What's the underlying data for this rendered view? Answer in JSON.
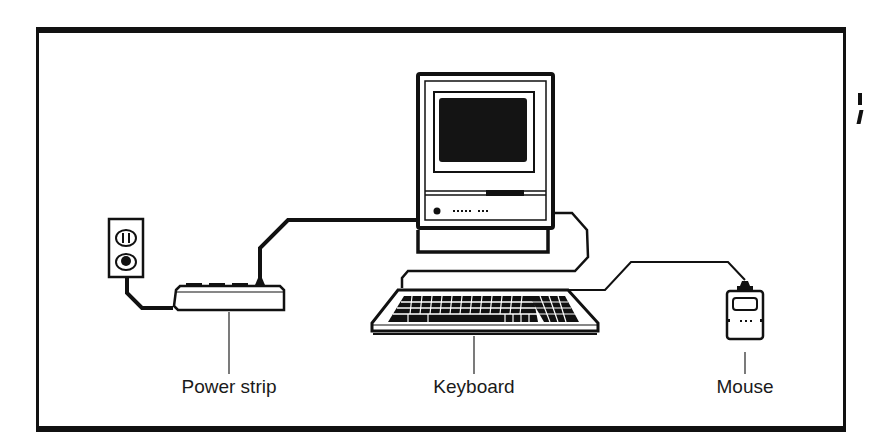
{
  "diagram": {
    "colors": {
      "line": "#111111",
      "background": "#ffffff",
      "screen": "#141414"
    },
    "components": [
      {
        "id": "wall-outlet",
        "name": "Wall outlet",
        "icon": "outlet-icon"
      },
      {
        "id": "power-strip",
        "name": "Power strip",
        "icon": "power-strip-icon"
      },
      {
        "id": "computer",
        "name": "Computer",
        "icon": "computer-icon"
      },
      {
        "id": "keyboard",
        "name": "Keyboard",
        "icon": "keyboard-icon"
      },
      {
        "id": "mouse",
        "name": "Mouse",
        "icon": "mouse-icon"
      }
    ],
    "connections": [
      {
        "from": "wall-outlet",
        "to": "power-strip",
        "type": "power cord"
      },
      {
        "from": "power-strip",
        "to": "computer",
        "type": "power cord"
      },
      {
        "from": "computer",
        "to": "keyboard",
        "type": "keyboard cable"
      },
      {
        "from": "keyboard",
        "to": "mouse",
        "type": "mouse cable"
      }
    ],
    "labels": {
      "power_strip": "Power strip",
      "keyboard": "Keyboard",
      "mouse": "Mouse"
    }
  }
}
